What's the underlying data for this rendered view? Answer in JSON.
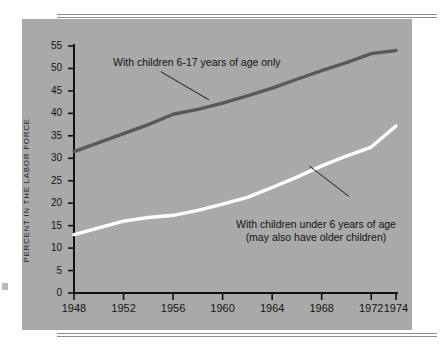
{
  "chart_data": {
    "type": "line",
    "title": "",
    "subtitle": "",
    "xlabel": "",
    "ylabel": "PERCENT IN THE LABOR FORCE",
    "xlim": [
      1948,
      1974
    ],
    "ylim": [
      0,
      55
    ],
    "grid": false,
    "legend_position": "inline-annotations",
    "xticks": [
      1948,
      1952,
      1956,
      1960,
      1964,
      1968,
      1972,
      1974
    ],
    "xtick_labels": [
      "1948",
      "1952",
      "1956",
      "1960",
      "1964",
      "1968",
      "1972",
      "1974"
    ],
    "yticks": [
      0,
      5,
      10,
      15,
      20,
      25,
      30,
      35,
      40,
      45,
      50,
      55
    ],
    "ytick_labels": [
      "0",
      "5",
      "10",
      "15",
      "20",
      "25",
      "30",
      "35",
      "40",
      "45",
      "50",
      "55"
    ],
    "series": [
      {
        "name": "With children 6-17 years of age only",
        "color": "#5a5a5a",
        "x": [
          1948,
          1950,
          1952,
          1954,
          1956,
          1958,
          1960,
          1962,
          1964,
          1966,
          1968,
          1970,
          1972,
          1974
        ],
        "values": [
          31.5,
          33.5,
          35.5,
          37.5,
          39.8,
          40.9,
          42.3,
          43.9,
          45.6,
          47.6,
          49.5,
          51.3,
          53.3,
          54.0
        ]
      },
      {
        "name": "With children under 6 years of age (may also have older children)",
        "color": "#ffffff",
        "x": [
          1948,
          1950,
          1952,
          1954,
          1956,
          1958,
          1960,
          1962,
          1964,
          1966,
          1968,
          1970,
          1972,
          1974
        ],
        "values": [
          13.0,
          14.5,
          16.0,
          16.8,
          17.3,
          18.4,
          19.8,
          21.3,
          23.5,
          25.8,
          28.3,
          30.5,
          32.5,
          37.2
        ]
      }
    ],
    "annotations": [
      {
        "name": "upper-series-label",
        "lines": [
          "With children 6-17 years of age only"
        ],
        "leader_from": [
          1955.0,
          49.3
        ],
        "leader_to": [
          1958.9,
          43.0
        ]
      },
      {
        "name": "lower-series-label",
        "lines": [
          "With children under 6 years of age",
          "(may also have older children)"
        ],
        "leader_from": [
          1970.2,
          21.5
        ],
        "leader_to": [
          1967.0,
          28.3
        ]
      }
    ]
  },
  "axis_title": "PERCENT IN THE LABOR FORCE",
  "annotation_upper": "With children 6-17 years of age only",
  "annotation_lower_line1": "With children under 6 years of age",
  "annotation_lower_line2": "(may also have older children)",
  "colors": {
    "panel_background": "#a9a9a9",
    "page_background": "#ffffff",
    "upper_series": "#5a5a5a",
    "lower_series": "#ffffff",
    "axis": "#101010",
    "rule": "#8d8d8d"
  }
}
